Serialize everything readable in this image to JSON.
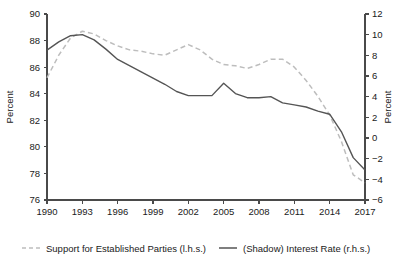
{
  "chart_data": {
    "type": "line",
    "title": "",
    "subtitle": "",
    "xlabel": "",
    "ylabel": "Percent",
    "y2label": "Percent",
    "grid": false,
    "legend_position": "bottom",
    "x": [
      1990,
      1991,
      1992,
      1993,
      1994,
      1995,
      1996,
      1997,
      1998,
      1999,
      2000,
      2001,
      2002,
      2003,
      2004,
      2005,
      2006,
      2007,
      2008,
      2009,
      2010,
      2011,
      2012,
      2013,
      2014,
      2015,
      2016,
      2017
    ],
    "xlim": [
      1990,
      2017
    ],
    "xticks": [
      1990,
      1993,
      1996,
      1999,
      2002,
      2005,
      2008,
      2011,
      2014,
      2017
    ],
    "xtick_labels": [
      "1990",
      "1993",
      "1996",
      "1999",
      "2002",
      "2005",
      "2008",
      "2011",
      "2014",
      "2017"
    ],
    "ylim": [
      76,
      90
    ],
    "yticks": [
      76,
      78,
      80,
      82,
      84,
      86,
      88,
      90
    ],
    "ytick_labels": [
      "76",
      "78",
      "80",
      "82",
      "84",
      "86",
      "88",
      "90"
    ],
    "y2lim": [
      -6,
      12
    ],
    "y2ticks": [
      -6,
      -4,
      -2,
      0,
      2,
      4,
      6,
      8,
      10,
      12
    ],
    "y2tick_labels": [
      "−6",
      "−4",
      "−2",
      "0",
      "2",
      "4",
      "6",
      "8",
      "10",
      "12"
    ],
    "series": [
      {
        "name": "Support for Established Parties (l.h.s.)",
        "axis": "left",
        "style": "dashed",
        "color": "#bdbdbd",
        "values": [
          85.2,
          86.9,
          88.2,
          88.7,
          88.5,
          88.0,
          87.6,
          87.3,
          87.2,
          87.0,
          86.9,
          87.3,
          87.7,
          87.3,
          86.6,
          86.2,
          86.1,
          85.9,
          86.2,
          86.6,
          86.6,
          86.0,
          85.0,
          83.8,
          82.4,
          80.4,
          77.9,
          77.3
        ]
      },
      {
        "name": "(Shadow) Interest Rate (r.h.s.)",
        "axis": "right",
        "style": "solid",
        "color": "#555555",
        "values": [
          8.5,
          9.3,
          9.9,
          10.0,
          9.5,
          8.6,
          7.6,
          7.0,
          6.4,
          5.8,
          5.2,
          4.5,
          4.1,
          4.1,
          4.1,
          5.3,
          4.3,
          3.9,
          3.9,
          4.0,
          3.4,
          3.2,
          3.0,
          2.6,
          2.3,
          0.6,
          -1.9,
          -3.1
        ]
      }
    ],
    "legend": [
      {
        "label": "Support for Established Parties (l.h.s.)",
        "style": "dashed",
        "color": "#bdbdbd"
      },
      {
        "label": "(Shadow) Interest Rate (r.h.s.)",
        "style": "solid",
        "color": "#555555"
      }
    ],
    "colors": {
      "dashed_series": "#bdbdbd",
      "solid_series": "#555555",
      "axis": "#4a4a4a",
      "text": "#1a1a1a",
      "background": "#ffffff"
    }
  }
}
